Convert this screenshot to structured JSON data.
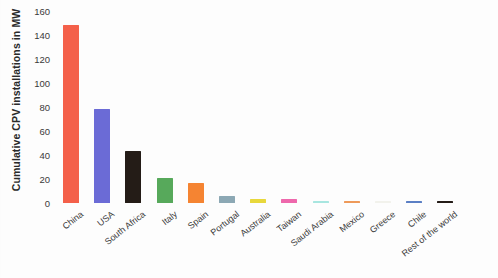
{
  "chart_data": {
    "type": "bar",
    "title": "",
    "xlabel": "",
    "ylabel": "Cumulative CPV installations in MW",
    "ylim": [
      0,
      160
    ],
    "ytick_labels": [
      "160",
      "140",
      "120",
      "100",
      "80",
      "60",
      "40",
      "20",
      "0"
    ],
    "ytick_values": [
      160,
      140,
      120,
      100,
      80,
      60,
      40,
      20,
      0
    ],
    "grid": false,
    "legend": "none",
    "categories": [
      "China",
      "USA",
      "South Africa",
      "Italy",
      "Spain",
      "Portugal",
      "Australia",
      "Taiwan",
      "Saudi Arabia",
      "Mexico",
      "Greece",
      "Chile",
      "Rest of the world"
    ],
    "values": [
      148,
      78,
      43,
      21,
      17,
      6,
      3,
      3,
      2,
      2,
      0.5,
      1.5,
      2
    ],
    "colors": [
      "#F4604A",
      "#6B6BD6",
      "#241C17",
      "#57A95B",
      "#F58432",
      "#8CA8B4",
      "#E8D83C",
      "#EE68AC",
      "#A8E6E0",
      "#EE9A5A",
      "#F2F2EC",
      "#5B7FC4",
      "#241C17"
    ]
  }
}
